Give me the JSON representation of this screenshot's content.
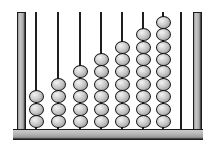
{
  "device": {
    "name": "abacus",
    "type": "counting-frame",
    "orientation": "vertical-rods"
  },
  "frame": {
    "left_post_label": "left-frame-post",
    "right_post_label": "right-frame-post",
    "base_label": "base-bar",
    "frame_color": "#a8a8a8",
    "outline_color": "#1c1c1c"
  },
  "beads": {
    "color": "#c6c6c6",
    "highlight_color": "#f2f2f2",
    "outline_color": "#141414",
    "shape": "sphere"
  },
  "chart_data": {
    "type": "bar",
    "xlabel": "Rod",
    "ylabel": "Beads",
    "categories": [
      "1",
      "2",
      "3",
      "4",
      "5",
      "6",
      "7",
      "8",
      "9"
    ],
    "values": [
      3,
      4,
      5,
      6,
      7,
      8,
      9,
      0,
      0
    ],
    "ylim": [
      0,
      10
    ],
    "grid": false,
    "legend": "none"
  },
  "rods": [
    {
      "id": "rod-1",
      "x": 35,
      "beads": 3,
      "rod_top": 12,
      "rod_color": "#1f1f1f"
    },
    {
      "id": "rod-2",
      "x": 57,
      "beads": 4,
      "rod_top": 12,
      "rod_color": "#1f1f1f"
    },
    {
      "id": "rod-3",
      "x": 79,
      "beads": 5,
      "rod_top": 12,
      "rod_color": "#1f1f1f"
    },
    {
      "id": "rod-4",
      "x": 100,
      "beads": 6,
      "rod_top": 12,
      "rod_color": "#1f1f1f"
    },
    {
      "id": "rod-5",
      "x": 121,
      "beads": 7,
      "rod_top": 12,
      "rod_color": "#1f1f1f"
    },
    {
      "id": "rod-6",
      "x": 142,
      "beads": 8,
      "rod_top": 12,
      "rod_color": "#1f1f1f"
    },
    {
      "id": "rod-7",
      "x": 162,
      "beads": 9,
      "rod_top": 12,
      "rod_color": "#1f1f1f"
    },
    {
      "id": "rod-8",
      "x": 180,
      "beads": 0,
      "rod_top": 12,
      "rod_color": "#1f1f1f"
    },
    {
      "id": "rod-9",
      "x": 180,
      "beads": 0,
      "rod_top": 12,
      "rod_color": "#1f1f1f"
    }
  ],
  "geometry": {
    "bead_width": 15,
    "bead_height": 13,
    "bead_pitch": 12.4,
    "base_top": 129,
    "bead_stack_bottom": 128,
    "rod_bottom": 130
  }
}
